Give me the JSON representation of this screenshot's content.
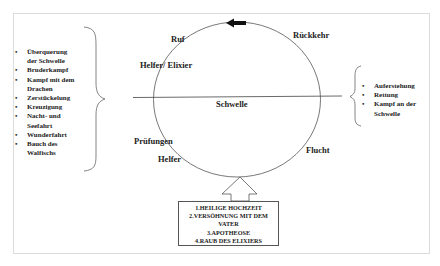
{
  "diagram": {
    "circle_labels": {
      "top_left": "Ruf",
      "left_upper": "Helfer/ Elixier",
      "top_right": "Rückkehr",
      "center": "Schwelle",
      "left_lower_1": "Prüfungen",
      "left_lower_2": "Helfer",
      "right_lower": "Flucht"
    },
    "left_list": [
      "Überquerung der Schwelle",
      "Bruderkampf",
      "Kampf mit dem Drachen",
      "Zerstückelung",
      "Kreuzigung",
      "Nacht- und Seefahrt",
      "Wunderfahrt",
      "Bauch des Walfischs"
    ],
    "left_list_lines": [
      "Überquerung",
      "der Schwelle",
      "Bruderkampf",
      "Kampf mit dem",
      "Drachen",
      "Zerstückelung",
      "Kreuzigung",
      "Nacht- und",
      "Seefahrt",
      "Wunderfahrt",
      "Bauch des",
      "Walfischs"
    ],
    "right_list": [
      "Auferstehung",
      "Rettung",
      "Kampf an der Schwelle"
    ],
    "right_list_lines": [
      "Auferstehung",
      "Rettung",
      "Kampf an der",
      "Schwelle"
    ],
    "boons_box": [
      "1.HEILIGE HOCHZEIT",
      "2.VERSÖHNUNG MIT DEM",
      "VATER",
      "3.APOTHEOSE",
      "4.RAUB DES ELIXIERS"
    ],
    "colors": {
      "line": "#555555",
      "text": "#222222",
      "frame": "#dcdcdc"
    }
  }
}
